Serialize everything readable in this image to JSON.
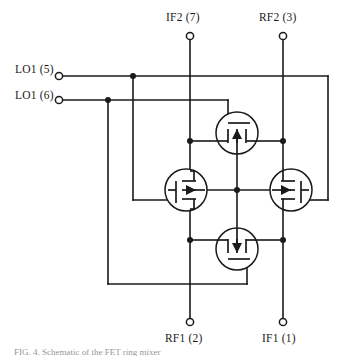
{
  "figure": {
    "type": "schematic",
    "caption": "FIG. 4. Schematic of the FET ring mixer"
  },
  "ports": {
    "if2": {
      "label": "IF2 (7)",
      "name": "IF2",
      "pin": "7",
      "position": "top-left-rail"
    },
    "rf2": {
      "label": "RF2 (3)",
      "name": "RF2",
      "pin": "3",
      "position": "top-right-rail"
    },
    "rf1": {
      "label": "RF1 (2)",
      "name": "RF1",
      "pin": "2",
      "position": "bottom-left-rail"
    },
    "if1": {
      "label": "IF1 (1)",
      "name": "IF1",
      "pin": "1",
      "position": "bottom-right-rail"
    },
    "lo5": {
      "label": "LO1 (5)",
      "name": "LO1",
      "pin": "5",
      "position": "left-upper"
    },
    "lo6": {
      "label": "LO1 (6)",
      "name": "LO1",
      "pin": "6",
      "position": "left-lower"
    }
  },
  "devices": [
    {
      "id": "q-top",
      "type": "mosfet",
      "orientation": "gate-up",
      "center_x": 237,
      "center_y": 133
    },
    {
      "id": "q-left",
      "type": "mosfet",
      "orientation": "gate-left",
      "center_x": 186,
      "center_y": 190
    },
    {
      "id": "q-right",
      "type": "mosfet",
      "orientation": "gate-right",
      "center_x": 291,
      "center_y": 190
    },
    {
      "id": "q-bottom",
      "type": "mosfet",
      "orientation": "gate-down",
      "center_x": 237,
      "center_y": 249
    }
  ],
  "colors": {
    "wire": "#1a1a1a",
    "background": "#ffffff",
    "text": "#1a1a1a"
  }
}
